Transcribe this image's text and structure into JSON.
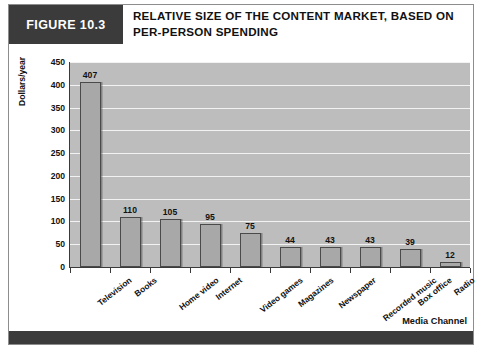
{
  "figure": {
    "tag": "FIGURE 10.3",
    "title_line1": "RELATIVE SIZE OF THE CONTENT MARKET, BASED ON",
    "title_line2": "PER-PERSON SPENDING",
    "tag_bg": "#3b3b3b",
    "footer_bg": "#3b3b3b"
  },
  "chart_data": {
    "type": "bar",
    "title": "RELATIVE SIZE OF THE CONTENT MARKET, BASED ON PER-PERSON SPENDING",
    "xlabel": "Media Channel",
    "ylabel": "Dollars/year",
    "categories": [
      "Television",
      "Books",
      "Home video",
      "Internet",
      "Video games",
      "Magazines",
      "Newspaper",
      "Recorded music",
      "Box office",
      "Radio"
    ],
    "values": [
      407,
      110,
      105,
      95,
      75,
      44,
      43,
      43,
      39,
      12
    ],
    "ylim": [
      0,
      450
    ],
    "yticks": [
      0,
      50,
      100,
      150,
      200,
      250,
      300,
      350,
      400,
      450
    ],
    "ytick_labels": [
      "0",
      "50",
      "100",
      "150",
      "200",
      "250",
      "300",
      "350",
      "400",
      "450"
    ],
    "grid": true,
    "legend": false,
    "bar_color": "#a8a8a8",
    "bar_edge_color": "#4a4a4a",
    "plot_bg": "#bdbdbd",
    "gridline_color": "#f2f2f2"
  }
}
